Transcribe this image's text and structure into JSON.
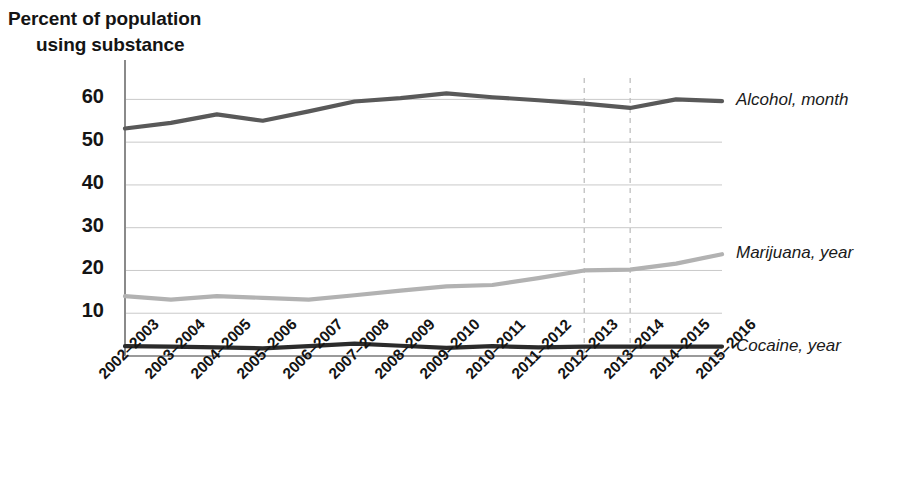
{
  "chart_data": {
    "type": "line",
    "title": "",
    "xlabel": "",
    "ylabel": "Percent of population using substance",
    "ylabel_line1": "Percent of population",
    "ylabel_line2": "using substance",
    "ylim": [
      0,
      65
    ],
    "yticks": [
      10,
      20,
      30,
      40,
      50,
      60
    ],
    "grid": true,
    "legend_position": "right-inline",
    "categories": [
      "2002–2003",
      "2003–2004",
      "2004–2005",
      "2005–2006",
      "2006–2007",
      "2007–2008",
      "2008–2009",
      "2009–2010",
      "2010–2011",
      "2011–2012",
      "2012–2013",
      "2013–2014",
      "2014–2015",
      "2015–2016"
    ],
    "series": [
      {
        "name": "Alcohol, month",
        "color": "#595959",
        "values": [
          53.2,
          54.5,
          56.5,
          55.0,
          57.2,
          59.5,
          60.3,
          61.4,
          60.5,
          59.8,
          59.0,
          58.0,
          60.0,
          59.6
        ]
      },
      {
        "name": "Marijuana, year",
        "color": "#b2b2b2",
        "values": [
          14.0,
          13.2,
          14.0,
          13.6,
          13.2,
          14.2,
          15.3,
          16.3,
          16.6,
          18.2,
          20.0,
          20.2,
          21.6,
          23.8
        ]
      },
      {
        "name": "Cocaine, year",
        "color": "#2b2b2b",
        "values": [
          2.3,
          2.2,
          2.0,
          1.8,
          2.3,
          2.9,
          2.4,
          1.9,
          2.3,
          2.0,
          2.2,
          2.2,
          2.2,
          2.2
        ]
      }
    ],
    "reference_lines": [
      {
        "category": "2012–2013",
        "style": "dashed",
        "color": "#bfbfbf"
      },
      {
        "category": "2013–2014",
        "style": "dashed",
        "color": "#bfbfbf"
      }
    ],
    "annotations": []
  }
}
